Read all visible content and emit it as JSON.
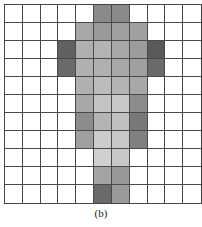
{
  "figure": {
    "caption": "(b)",
    "rows": 11,
    "cols": 11,
    "default_color": "#ffffff",
    "grid_line_color": "#4a4a4a",
    "cells": [
      [
        "#ffffff",
        "#ffffff",
        "#ffffff",
        "#ffffff",
        "#ffffff",
        "#8a8a8a",
        "#8a8a8a",
        "#ffffff",
        "#ffffff",
        "#ffffff",
        "#ffffff"
      ],
      [
        "#ffffff",
        "#ffffff",
        "#ffffff",
        "#ffffff",
        "#a8a8a8",
        "#9a9a9a",
        "#a0a0a0",
        "#a0a0a0",
        "#ffffff",
        "#ffffff",
        "#ffffff"
      ],
      [
        "#ffffff",
        "#ffffff",
        "#ffffff",
        "#606060",
        "#b0b0b0",
        "#b4b4b4",
        "#a8a8a8",
        "#9c9c9c",
        "#5a5a5a",
        "#ffffff",
        "#ffffff"
      ],
      [
        "#ffffff",
        "#ffffff",
        "#ffffff",
        "#6a6a6a",
        "#b0b0b0",
        "#b0b0b0",
        "#a8a8a8",
        "#a0a0a0",
        "#6a6a6a",
        "#ffffff",
        "#ffffff"
      ],
      [
        "#ffffff",
        "#ffffff",
        "#ffffff",
        "#ffffff",
        "#b0b0b0",
        "#bcbcbc",
        "#b4b4b4",
        "#a8a8a8",
        "#ffffff",
        "#ffffff",
        "#ffffff"
      ],
      [
        "#ffffff",
        "#ffffff",
        "#ffffff",
        "#ffffff",
        "#a8a8a8",
        "#c4c4c4",
        "#c8c8c8",
        "#8c8c8c",
        "#ffffff",
        "#ffffff",
        "#ffffff"
      ],
      [
        "#ffffff",
        "#ffffff",
        "#ffffff",
        "#ffffff",
        "#8c8c8c",
        "#b4b4b4",
        "#c0c0c0",
        "#787878",
        "#ffffff",
        "#ffffff",
        "#ffffff"
      ],
      [
        "#ffffff",
        "#ffffff",
        "#ffffff",
        "#ffffff",
        "#a0a0a0",
        "#cccccc",
        "#c8c8c8",
        "#808080",
        "#ffffff",
        "#ffffff",
        "#ffffff"
      ],
      [
        "#ffffff",
        "#ffffff",
        "#ffffff",
        "#ffffff",
        "#ffffff",
        "#d0d0d0",
        "#c8c8c8",
        "#ffffff",
        "#ffffff",
        "#ffffff",
        "#ffffff"
      ],
      [
        "#ffffff",
        "#ffffff",
        "#ffffff",
        "#ffffff",
        "#ffffff",
        "#a4a4a4",
        "#989898",
        "#ffffff",
        "#ffffff",
        "#ffffff",
        "#ffffff"
      ],
      [
        "#ffffff",
        "#ffffff",
        "#ffffff",
        "#ffffff",
        "#ffffff",
        "#6a6a6a",
        "#9a9a9a",
        "#ffffff",
        "#ffffff",
        "#ffffff",
        "#ffffff"
      ]
    ]
  }
}
